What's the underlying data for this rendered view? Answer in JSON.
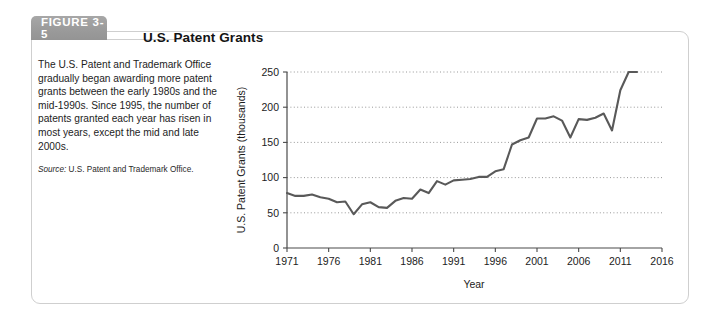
{
  "figure": {
    "tab_label": "FIGURE 3-5",
    "title": "U.S. Patent Grants",
    "caption": "The U.S. Patent and Trademark Office gradually began awarding more patent grants between the early 1980s and the mid-1990s. Since 1995, the number of patents granted each year has risen in most years, except the mid and late 2000s.",
    "source_label": "Source:",
    "source_text": " U.S. Patent and Trademark Office.",
    "tab_color": "#9b9b9b",
    "border_color": "#cfcfcf",
    "line_color": "#595959"
  },
  "chart_data": {
    "type": "line",
    "title": "U.S. Patent Grants",
    "xlabel": "Year",
    "ylabel": "U.S. Patent Grants (thousands)",
    "xlim": [
      1971,
      2016
    ],
    "ylim": [
      0,
      250
    ],
    "xticks": [
      1971,
      1976,
      1981,
      1986,
      1991,
      1996,
      2001,
      2006,
      2011,
      2016
    ],
    "yticks": [
      0,
      50,
      100,
      150,
      200,
      250
    ],
    "grid": "horizontal-dotted",
    "legend": "none",
    "series": [
      {
        "name": "U.S. Patent Grants (thousands)",
        "x": [
          1971,
          1972,
          1973,
          1974,
          1975,
          1976,
          1977,
          1978,
          1979,
          1980,
          1981,
          1982,
          1983,
          1984,
          1985,
          1986,
          1987,
          1988,
          1989,
          1990,
          1991,
          1992,
          1993,
          1994,
          1995,
          1996,
          1997,
          1998,
          1999,
          2000,
          2001,
          2002,
          2003,
          2004,
          2005,
          2006,
          2007,
          2008,
          2009,
          2010,
          2011,
          2012,
          2013
        ],
        "values": [
          78,
          74,
          74,
          76,
          72,
          70,
          65,
          66,
          48,
          62,
          65,
          58,
          57,
          67,
          71,
          70,
          83,
          78,
          95,
          90,
          96,
          97,
          98,
          101,
          101,
          109,
          112,
          147,
          153,
          157,
          184,
          184,
          187,
          181,
          157,
          183,
          182,
          185,
          191,
          167,
          224,
          253,
          277
        ]
      }
    ]
  }
}
